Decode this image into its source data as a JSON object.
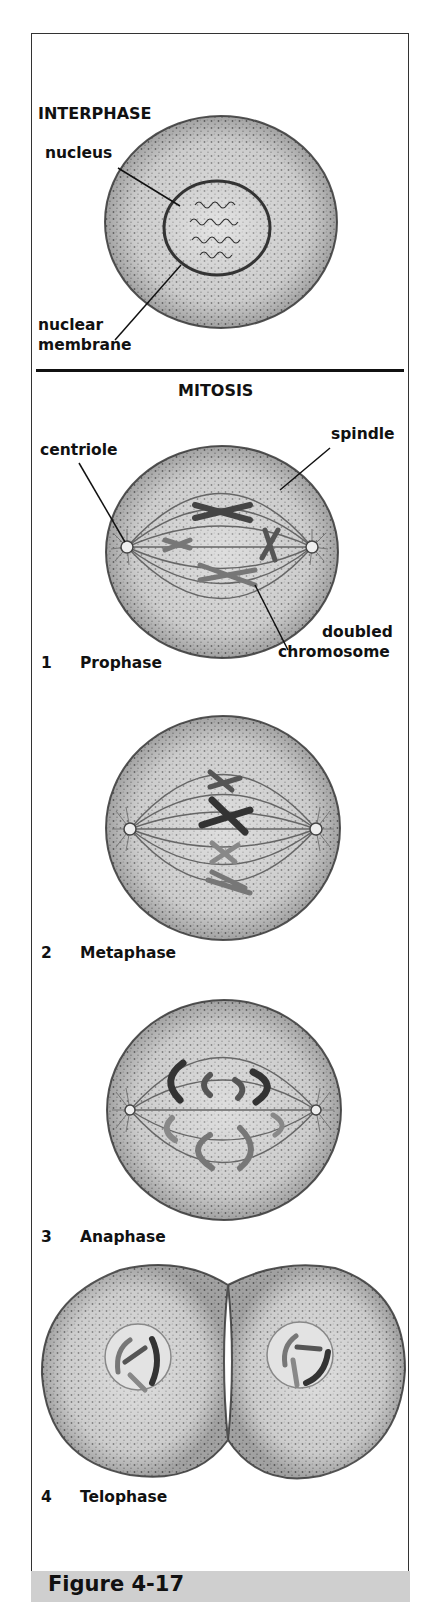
{
  "interphase": {
    "heading": "INTERPHASE",
    "labels": {
      "nucleus": "nucleus",
      "nuclear_membrane_1": "nuclear",
      "nuclear_membrane_2": "membrane"
    }
  },
  "mitosis": {
    "heading": "MITOSIS",
    "labels": {
      "centriole": "centriole",
      "spindle": "spindle",
      "doubled_chromosome_1": "doubled",
      "doubled_chromosome_2": "chromosome"
    },
    "stages": [
      {
        "number": "1",
        "name": "Prophase"
      },
      {
        "number": "2",
        "name": "Metaphase"
      },
      {
        "number": "3",
        "name": "Anaphase"
      },
      {
        "number": "4",
        "name": "Telophase"
      }
    ]
  },
  "caption": {
    "figure_label": "Figure 4-17"
  },
  "colors": {
    "cell_fill": "#b9b9b9",
    "cell_edge": "#555555",
    "caption_bar": "#cfcfcf",
    "ink": "#111111"
  }
}
